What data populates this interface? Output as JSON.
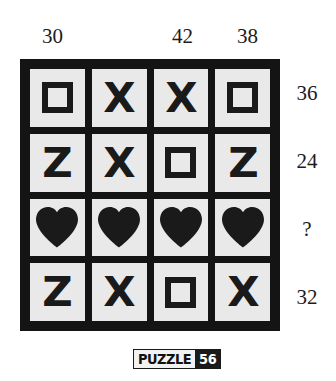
{
  "puzzle": {
    "footer_label": "PUZZLE",
    "footer_number": "56",
    "colors": {
      "ink": "#1a1a1a",
      "cell_background": "#e9e9e9",
      "page_background": "#ffffff",
      "banner_number_background": "#1a1a1a",
      "banner_number_text": "#ffffff"
    },
    "column_headers": [
      {
        "value": "30"
      },
      {
        "value": ""
      },
      {
        "value": "42"
      },
      {
        "value": "38"
      }
    ],
    "row_labels": [
      {
        "value": "36"
      },
      {
        "value": "24"
      },
      {
        "value": "?"
      },
      {
        "value": "32"
      }
    ],
    "grid": {
      "rows": 4,
      "columns": 4,
      "cells": [
        [
          {
            "symbol": "square-outline-icon",
            "text": ""
          },
          {
            "symbol": "letter-x-icon",
            "text": "X"
          },
          {
            "symbol": "letter-x-icon",
            "text": "X"
          },
          {
            "symbol": "square-outline-icon",
            "text": ""
          }
        ],
        [
          {
            "symbol": "letter-z-icon",
            "text": "Z"
          },
          {
            "symbol": "letter-x-icon",
            "text": "X"
          },
          {
            "symbol": "square-outline-icon",
            "text": ""
          },
          {
            "symbol": "letter-z-icon",
            "text": "Z"
          }
        ],
        [
          {
            "symbol": "heart-icon",
            "text": ""
          },
          {
            "symbol": "heart-icon",
            "text": ""
          },
          {
            "symbol": "heart-icon",
            "text": ""
          },
          {
            "symbol": "heart-icon",
            "text": ""
          }
        ],
        [
          {
            "symbol": "letter-z-icon",
            "text": "Z"
          },
          {
            "symbol": "letter-x-icon",
            "text": "X"
          },
          {
            "symbol": "square-outline-icon",
            "text": ""
          },
          {
            "symbol": "letter-x-icon",
            "text": "X"
          }
        ]
      ]
    }
  }
}
